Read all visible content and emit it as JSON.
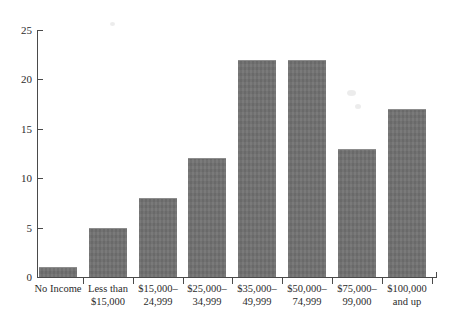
{
  "chart_data": {
    "type": "bar",
    "title": "",
    "subtitle": "",
    "xlabel": "",
    "ylabel": "",
    "ylim": [
      0,
      25
    ],
    "yticks": [
      0,
      5,
      10,
      15,
      20,
      25
    ],
    "grid": false,
    "legend": null,
    "bar_color": "#6f6f6f",
    "axis_color": "#4a4a4a",
    "background_color": "#ffffff",
    "categories": [
      "No Income",
      "Less than $15,000",
      "$15,000–24,999",
      "$25,000–34,999",
      "$35,000–49,999",
      "$50,000–74,999",
      "$75,000–99,000",
      "$100,000 and up"
    ],
    "category_lines": [
      [
        "No Income",
        ""
      ],
      [
        "Less than",
        "$15,000"
      ],
      [
        "$15,000–",
        "24,999"
      ],
      [
        "$25,000–",
        "34,999"
      ],
      [
        "$35,000–",
        "49,999"
      ],
      [
        "$50,000–",
        "74,999"
      ],
      [
        "$75,000–",
        "99,000"
      ],
      [
        "$100,000",
        "and up"
      ]
    ],
    "values": [
      1,
      5,
      8,
      12,
      22,
      22,
      13,
      17
    ]
  },
  "axis": {
    "y_tick_labels": [
      "0",
      "5",
      "10",
      "15",
      "20",
      "25"
    ]
  }
}
